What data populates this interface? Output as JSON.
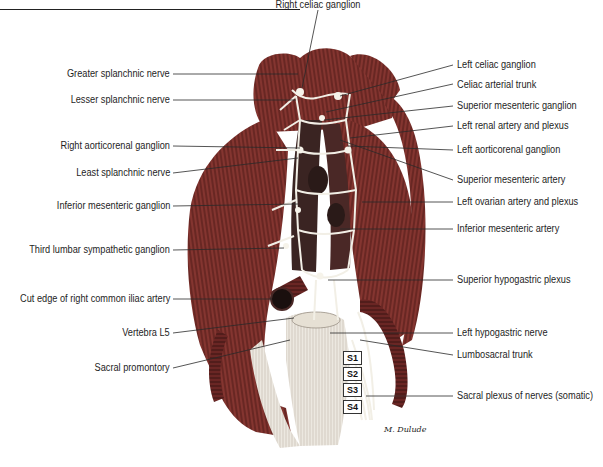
{
  "figure": {
    "type": "anatomical-illustration",
    "artist_signature": "M. Dulude",
    "colors": {
      "muscle": "#7a2e2a",
      "muscle_dark": "#4e1a18",
      "muscle_light": "#a24a42",
      "nerve": "#f2efe6",
      "vessel": "#3a2422",
      "label_text": "#1e1e1e",
      "leader_line": "#2a2a2a"
    }
  },
  "labels": {
    "top": [
      {
        "text": "Right celiac ganglion"
      }
    ],
    "left": [
      {
        "text": "Greater splanchnic nerve"
      },
      {
        "text": "Lesser splanchnic nerve"
      },
      {
        "text": "Right aorticorenal ganglion"
      },
      {
        "text": "Least splanchnic nerve"
      },
      {
        "text": "Inferior mesenteric ganglion"
      },
      {
        "text": "Third lumbar sympathetic ganglion"
      },
      {
        "text": "Cut edge of right common iliac artery"
      },
      {
        "text": "Vertebra L5"
      },
      {
        "text": "Sacral promontory"
      }
    ],
    "right": [
      {
        "text": "Left celiac ganglion"
      },
      {
        "text": "Celiac arterial trunk"
      },
      {
        "text": "Superior mesenteric ganglion"
      },
      {
        "text": "Left renal artery and plexus"
      },
      {
        "text": "Left aorticorenal ganglion"
      },
      {
        "text": "Superior mesenteric artery"
      },
      {
        "text": "Left ovarian artery and plexus"
      },
      {
        "text": "Inferior mesenteric artery"
      },
      {
        "text": "Superior hypogastric plexus"
      },
      {
        "text": "Left hypogastric nerve"
      },
      {
        "text": "Lumbosacral trunk"
      },
      {
        "text": "Sacral plexus of nerves (somatic)"
      }
    ]
  },
  "sacral_markers": [
    "S1",
    "S2",
    "S3",
    "S4"
  ]
}
